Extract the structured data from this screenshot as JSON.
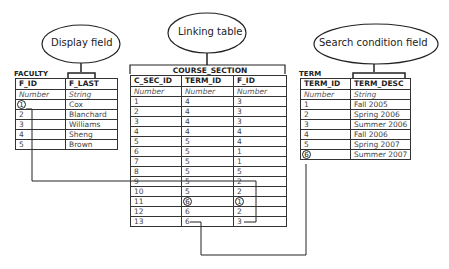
{
  "callouts": {
    "display_field": "Display field",
    "linking_table": "Linking table",
    "search_condition_field": "Search condition field"
  },
  "faculty": {
    "name": "FACULTY",
    "headers": [
      "F_ID",
      "F_LAST"
    ],
    "types": [
      "Number",
      "String"
    ],
    "rows": [
      [
        "1",
        "Cox"
      ],
      [
        "2",
        "Blanchard"
      ],
      [
        "3",
        "Williams"
      ],
      [
        "4",
        "Sheng"
      ],
      [
        "5",
        "Brown"
      ]
    ]
  },
  "course_section": {
    "name": "COURSE_SECTION",
    "headers": [
      "C_SEC_ID",
      "TERM_ID",
      "F_ID"
    ],
    "types": [
      "Number",
      "Number",
      "Number"
    ],
    "rows": [
      [
        "1",
        "4",
        "3"
      ],
      [
        "2",
        "4",
        "3"
      ],
      [
        "3",
        "4",
        "3"
      ],
      [
        "4",
        "4",
        "4"
      ],
      [
        "5",
        "5",
        "4"
      ],
      [
        "6",
        "5",
        "1"
      ],
      [
        "7",
        "5",
        "1"
      ],
      [
        "8",
        "5",
        "5"
      ],
      [
        "9",
        "5",
        "2"
      ],
      [
        "10",
        "5",
        "2"
      ],
      [
        "11",
        "6",
        "1"
      ],
      [
        "12",
        "6",
        "2"
      ],
      [
        "13",
        "6",
        "3"
      ]
    ]
  },
  "term": {
    "name": "TERM",
    "headers": [
      "TERM_ID",
      "TERM_DESC"
    ],
    "types": [
      "Number",
      "String"
    ],
    "rows": [
      [
        "1",
        "Fall 2005"
      ],
      [
        "2",
        "Spring 2006"
      ],
      [
        "3",
        "Summer 2006"
      ],
      [
        "4",
        "Fall 2006"
      ],
      [
        "5",
        "Spring 2007"
      ],
      [
        "6",
        "Summer 2007"
      ]
    ]
  },
  "highlights": {
    "faculty_f_id": "1",
    "course_section_row": "11",
    "term_term_id": "6"
  }
}
